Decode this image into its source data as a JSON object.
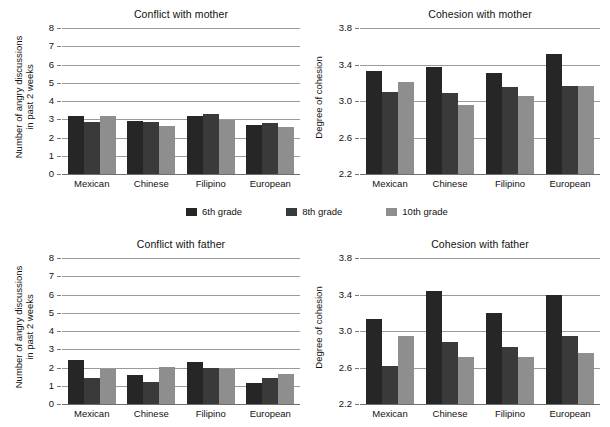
{
  "figure": {
    "legend": {
      "items": [
        {
          "label": "6th grade",
          "color": "#262626",
          "key": "6th"
        },
        {
          "label": "8th grade",
          "color": "#3a3a3a",
          "key": "8th"
        },
        {
          "label": "10th grade",
          "color": "#8e8e8e",
          "key": "10th"
        }
      ]
    }
  },
  "chart_data": [
    {
      "id": "conflict-with-mother",
      "type": "bar",
      "title": "Conflict with mother",
      "xlabel": "",
      "ylabel": "Number of angry discussions in past 2 weeks",
      "ylabel_lines": [
        "Number of angry discussions",
        "in past 2 weeks"
      ],
      "categories": [
        "Mexican",
        "Chinese",
        "Filipino",
        "European"
      ],
      "ylim": [
        0,
        8
      ],
      "yticks": [
        0,
        1,
        2,
        3,
        4,
        5,
        6,
        7,
        8
      ],
      "ytick_labels": [
        "0",
        "1",
        "2",
        "3",
        "4",
        "5",
        "6",
        "7",
        "8"
      ],
      "grid": true,
      "legend_position": "below-figure",
      "series": [
        {
          "name": "6th grade",
          "color": "#262626",
          "values": [
            3.2,
            2.9,
            3.2,
            2.7
          ]
        },
        {
          "name": "8th grade",
          "color": "#3a3a3a",
          "values": [
            2.85,
            2.85,
            3.3,
            2.8
          ]
        },
        {
          "name": "10th grade",
          "color": "#8e8e8e",
          "values": [
            3.2,
            2.65,
            2.95,
            2.6
          ]
        }
      ]
    },
    {
      "id": "cohesion-with-mother",
      "type": "bar",
      "title": "Cohesion with mother",
      "xlabel": "",
      "ylabel": "Degree of cohesion",
      "ylabel_lines": [
        "Degree of cohesion"
      ],
      "categories": [
        "Mexican",
        "Chinese",
        "Filipino",
        "European"
      ],
      "ylim": [
        2.2,
        3.8
      ],
      "yticks": [
        2.2,
        2.6,
        3.0,
        3.4,
        3.8
      ],
      "ytick_labels": [
        "2.2",
        "2.6",
        "3.0",
        "3.4",
        "3.8"
      ],
      "grid": true,
      "legend_position": "above-figure",
      "series": [
        {
          "name": "6th grade",
          "color": "#262626",
          "values": [
            3.33,
            3.37,
            3.31,
            3.52
          ]
        },
        {
          "name": "8th grade",
          "color": "#3a3a3a",
          "values": [
            3.1,
            3.09,
            3.15,
            3.17
          ]
        },
        {
          "name": "10th grade",
          "color": "#8e8e8e",
          "values": [
            3.21,
            2.96,
            3.05,
            3.17
          ]
        }
      ]
    },
    {
      "id": "conflict-with-father",
      "type": "bar",
      "title": "Conflict with father",
      "xlabel": "",
      "ylabel": "Number of angry discussions in past 2 weeks",
      "ylabel_lines": [
        "Number of angry discussions",
        "in past 2 weeks"
      ],
      "categories": [
        "Mexican",
        "Chinese",
        "Filipino",
        "European"
      ],
      "ylim": [
        0,
        8
      ],
      "yticks": [
        0,
        1,
        2,
        3,
        4,
        5,
        6,
        7,
        8
      ],
      "ytick_labels": [
        "0",
        "1",
        "2",
        "3",
        "4",
        "5",
        "6",
        "7",
        "8"
      ],
      "grid": true,
      "legend_position": "above-figure",
      "series": [
        {
          "name": "6th grade",
          "color": "#262626",
          "values": [
            2.4,
            1.6,
            2.3,
            1.15
          ]
        },
        {
          "name": "8th grade",
          "color": "#3a3a3a",
          "values": [
            1.4,
            1.2,
            2.0,
            1.45
          ]
        },
        {
          "name": "10th grade",
          "color": "#8e8e8e",
          "values": [
            1.9,
            2.05,
            1.9,
            1.65
          ]
        }
      ]
    },
    {
      "id": "cohesion-with-father",
      "type": "bar",
      "title": "Cohesion with father",
      "xlabel": "",
      "ylabel": "Degree of cohesion",
      "ylabel_lines": [
        "Degree of cohesion"
      ],
      "categories": [
        "Mexican",
        "Chinese",
        "Filipino",
        "European"
      ],
      "ylim": [
        2.2,
        3.8
      ],
      "yticks": [
        2.2,
        2.6,
        3.0,
        3.4,
        3.8
      ],
      "ytick_labels": [
        "2.2",
        "2.6",
        "3.0",
        "3.4",
        "3.8"
      ],
      "grid": true,
      "legend_position": "above-figure",
      "series": [
        {
          "name": "6th grade",
          "color": "#262626",
          "values": [
            3.13,
            3.44,
            3.2,
            3.4
          ]
        },
        {
          "name": "8th grade",
          "color": "#3a3a3a",
          "values": [
            2.62,
            2.88,
            2.83,
            2.94
          ]
        },
        {
          "name": "10th grade",
          "color": "#8e8e8e",
          "values": [
            2.94,
            2.72,
            2.72,
            2.76
          ]
        }
      ]
    }
  ]
}
